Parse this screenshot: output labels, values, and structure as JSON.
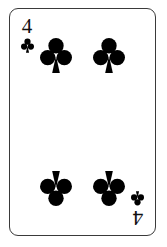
{
  "card": {
    "rank": "4",
    "suit_name": "clubs",
    "suit_symbol": "♣",
    "full_name": "Four of Clubs",
    "card_color": "#000000",
    "face_color": "#ffffff",
    "border_color": "#3a3a3a",
    "background_color": "#ffffff",
    "indices": [
      {
        "position": "top-left",
        "rank": "4",
        "suit_symbol": "♣",
        "orientation": "upright"
      },
      {
        "position": "bottom-right",
        "rank": "4",
        "suit_symbol": "♣",
        "orientation": "inverted"
      }
    ],
    "pips": [
      {
        "position": "top-left",
        "suit_symbol": "♣",
        "orientation": "upright"
      },
      {
        "position": "top-right",
        "suit_symbol": "♣",
        "orientation": "upright"
      },
      {
        "position": "bottom-left",
        "suit_symbol": "♣",
        "orientation": "inverted"
      },
      {
        "position": "bottom-right",
        "suit_symbol": "♣",
        "orientation": "inverted"
      }
    ],
    "pip_count": 4
  }
}
